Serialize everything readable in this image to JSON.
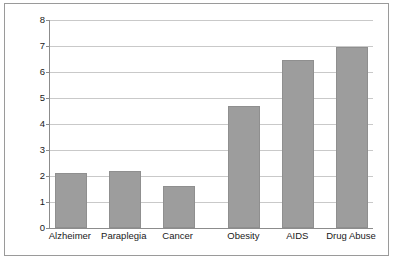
{
  "chart_data": {
    "type": "bar",
    "title": "",
    "subtitle": "",
    "xlabel": "",
    "ylabel": "",
    "categories": [
      "Alzheimer",
      "Paraplegia",
      "Cancer",
      "Obesity",
      "AIDS",
      "Drug Abuse"
    ],
    "values": [
      2.1,
      2.2,
      1.6,
      4.7,
      6.45,
      6.95
    ],
    "ylim": [
      0,
      8
    ],
    "ytick_labels": [
      "0",
      "1",
      "2",
      "3",
      "4",
      "5",
      "6",
      "7",
      "8"
    ],
    "ytick_values": [
      0,
      1,
      2,
      3,
      4,
      5,
      6,
      7,
      8
    ],
    "grid": true,
    "legend": "none",
    "bar_color": "#9d9d9d",
    "bar_edge_color": "#8f8f8f",
    "gridline_color": "#c9c9c9",
    "axis_color": "#8c8c8c",
    "frame_color": "#9a9a9a",
    "background_color": "#ffffff",
    "gap_after_index": 2
  }
}
